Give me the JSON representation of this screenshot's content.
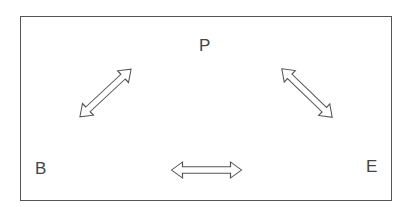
{
  "diagram": {
    "nodes": [
      {
        "id": "P",
        "label": "P",
        "x": 199,
        "y": 37
      },
      {
        "id": "B",
        "label": "B",
        "x": 35,
        "y": 160
      },
      {
        "id": "E",
        "label": "E",
        "x": 366,
        "y": 158
      }
    ],
    "edges": [
      {
        "from": "B",
        "to": "P",
        "type": "double-arrow"
      },
      {
        "from": "P",
        "to": "E",
        "type": "double-arrow"
      },
      {
        "from": "B",
        "to": "E",
        "type": "double-arrow"
      }
    ],
    "colors": {
      "stroke": "#555555",
      "text": "#444444",
      "background": "#ffffff"
    }
  }
}
